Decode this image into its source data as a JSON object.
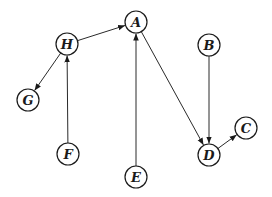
{
  "graph": {
    "type": "directed",
    "node_radius": 11,
    "colors": {
      "stroke": "#1a1a1a",
      "fill": "#ffffff",
      "text": "#1a1a1a"
    },
    "nodes": [
      {
        "id": "A",
        "label": "A",
        "x": 136,
        "y": 22
      },
      {
        "id": "B",
        "label": "B",
        "x": 209,
        "y": 45
      },
      {
        "id": "C",
        "label": "C",
        "x": 246,
        "y": 128
      },
      {
        "id": "D",
        "label": "D",
        "x": 209,
        "y": 155
      },
      {
        "id": "E",
        "label": "E",
        "x": 136,
        "y": 177
      },
      {
        "id": "F",
        "label": "F",
        "x": 68,
        "y": 154
      },
      {
        "id": "G",
        "label": "G",
        "x": 28,
        "y": 100
      },
      {
        "id": "H",
        "label": "H",
        "x": 67,
        "y": 44
      }
    ],
    "edges": [
      {
        "from": "H",
        "to": "A"
      },
      {
        "from": "H",
        "to": "G"
      },
      {
        "from": "F",
        "to": "H"
      },
      {
        "from": "E",
        "to": "A"
      },
      {
        "from": "A",
        "to": "D"
      },
      {
        "from": "B",
        "to": "D"
      },
      {
        "from": "D",
        "to": "C"
      }
    ]
  }
}
